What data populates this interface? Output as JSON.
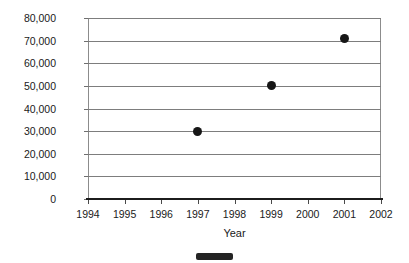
{
  "chart_data": {
    "type": "scatter",
    "title": "",
    "xlabel": "Year",
    "ylabel": "Oranges Produced",
    "x": [
      1997,
      1999,
      2001
    ],
    "values": [
      30000,
      50000,
      71000
    ],
    "series": [
      {
        "name": "Oranges Produced",
        "points": [
          {
            "x": 1997,
            "y": 30000
          },
          {
            "x": 1999,
            "y": 50000
          },
          {
            "x": 2001,
            "y": 71000
          }
        ],
        "marker": "filled-circle",
        "color": "#161616"
      }
    ],
    "xlim": [
      1994,
      2002
    ],
    "ylim": [
      0,
      80000
    ],
    "x_tick_labels": [
      "1994",
      "1995",
      "1996",
      "1997",
      "1998",
      "1999",
      "2000",
      "2001",
      "2002"
    ],
    "x_ticks": [
      1994,
      1995,
      1996,
      1997,
      1998,
      1999,
      2000,
      2001,
      2002
    ],
    "y_tick_labels": [
      "80,000",
      "70,000",
      "60,000",
      "50,000",
      "40,000",
      "30,000",
      "20,000",
      "10,000",
      "0"
    ],
    "y_ticks": [
      80000,
      70000,
      60000,
      50000,
      40000,
      30000,
      20000,
      10000,
      0
    ],
    "grid": "horizontal",
    "legend": "none",
    "colors": {
      "marker": "#161616",
      "gridline": "#7d7d7d",
      "axis": "#1c1c1c",
      "frame": "#8c8c8c",
      "text": "#1a1a1a",
      "background": "#ffffff"
    }
  },
  "artifacts": {
    "legend_bar_label": "legend-swatch-artifact"
  }
}
